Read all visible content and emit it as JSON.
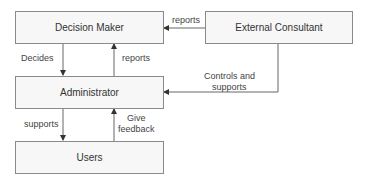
{
  "nodes": {
    "decision_maker": "Decision Maker",
    "external_consultant": "External Consultant",
    "administrator": "Administrator",
    "users": "Users"
  },
  "edges": {
    "consultant_to_decision": "reports",
    "decision_to_admin": "Decides",
    "admin_to_decision": "reports",
    "consultant_to_admin_line1": "Controls and",
    "consultant_to_admin_line2": "supports",
    "admin_to_users": "supports",
    "users_to_admin_line1": "Give",
    "users_to_admin_line2": "feedback"
  },
  "colors": {
    "box_fill": "#f7f7f7",
    "box_border": "#8a8a8a",
    "line": "#666666"
  }
}
